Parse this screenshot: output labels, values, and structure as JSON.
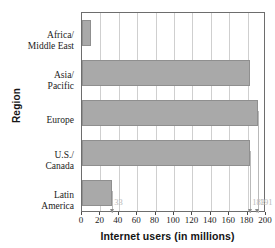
{
  "chart_data": {
    "type": "bar",
    "orientation": "horizontal",
    "title": "",
    "xlabel": "Internet users (in millions)",
    "ylabel": "Region",
    "categories": [
      "Africa/ Middle East",
      "Asia/ Pacific",
      "Europe",
      "U.S./ Canada",
      "Latin America"
    ],
    "values": [
      10,
      183,
      191,
      183,
      33
    ],
    "xlim": [
      0,
      200
    ],
    "xticks": [
      0,
      20,
      40,
      60,
      80,
      100,
      120,
      140,
      160,
      180,
      200
    ],
    "xtick_labels": [
      "0",
      "20",
      "40",
      "60",
      "80",
      "100",
      "120",
      "140",
      "160",
      "180",
      "200"
    ],
    "grid": true,
    "legend": "none",
    "bar_color": "#a9a9a9",
    "annotation_color": "#b9b9b9",
    "annotations": [
      {
        "value": 33,
        "label": "33"
      },
      {
        "value": 183,
        "label": "183"
      },
      {
        "value": 191,
        "label": "191"
      }
    ]
  },
  "axes": {
    "y_title": "Region",
    "x_title": "Internet users (in millions)",
    "category_labels": [
      {
        "line1": "Africa/",
        "line2": "Middle East"
      },
      {
        "line1": "Asia/",
        "line2": "Pacific"
      },
      {
        "line1": "Europe",
        "line2": ""
      },
      {
        "line1": "U.S./",
        "line2": "Canada"
      },
      {
        "line1": "Latin",
        "line2": "America"
      }
    ]
  }
}
